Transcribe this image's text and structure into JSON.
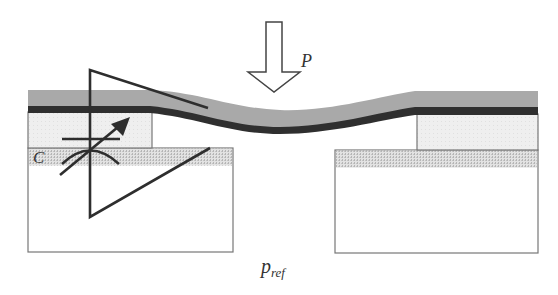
{
  "diagram": {
    "labels": {
      "pressure": "P",
      "capacitance": "C",
      "reference_pressure_main": "p",
      "reference_pressure_sub": "ref"
    },
    "components": [
      {
        "name": "applied-pressure-arrow",
        "description": "hollow downward arrow"
      },
      {
        "name": "deflecting-membrane",
        "description": "gray layer over dark electrode layer"
      },
      {
        "name": "left-spacer",
        "description": "light dotted block"
      },
      {
        "name": "right-spacer",
        "description": "light dotted block"
      },
      {
        "name": "left-substrate",
        "description": "white block with dotted electrode strip"
      },
      {
        "name": "right-substrate",
        "description": "white block with dotted electrode strip"
      },
      {
        "name": "variable-capacitor-symbol"
      },
      {
        "name": "triangle-outline"
      }
    ],
    "colors": {
      "membrane_top": "#a9a9a9",
      "electrode_dark": "#333333",
      "spacer_fill": "#ececec",
      "dotted_strip": "#c8c8c8",
      "line": "#555555",
      "symbol": "#2e2e2e"
    }
  }
}
